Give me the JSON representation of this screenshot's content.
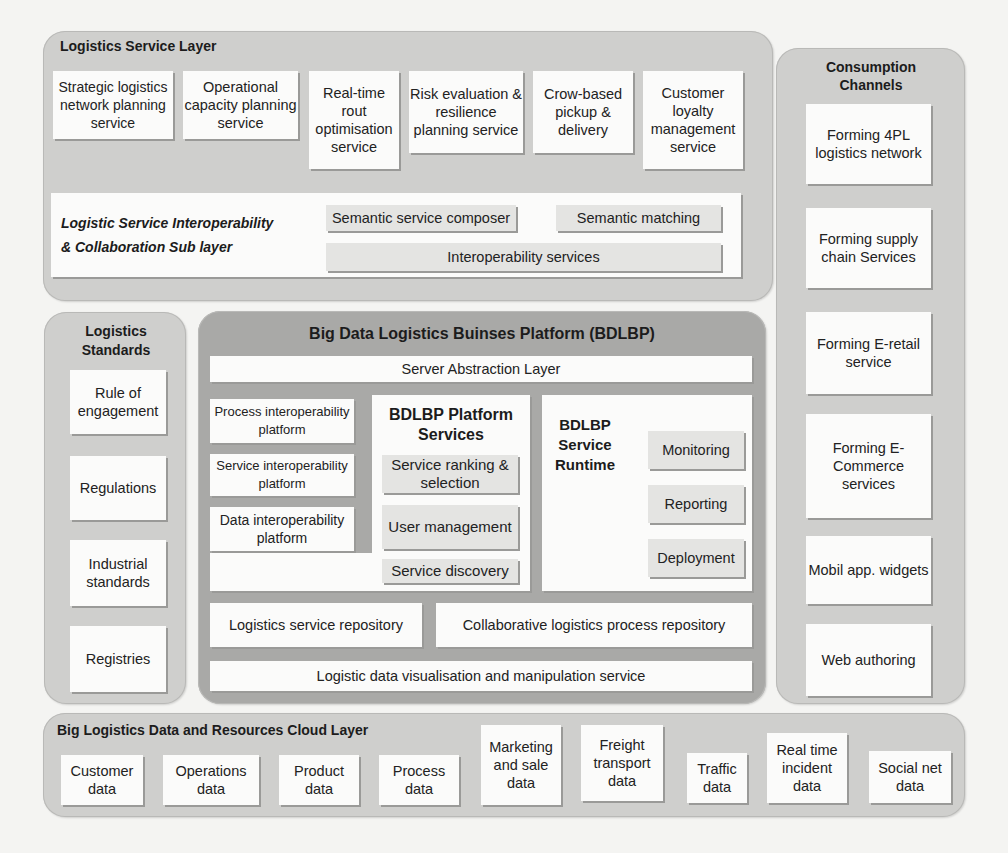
{
  "diagram": {
    "service_layer": {
      "title": "Logistics Service Layer",
      "services": [
        "Strategic logistics network planning service",
        "Operational capacity planning service",
        "Real-time rout optimisation service",
        "Risk evaluation & resilience planning service",
        "Crow-based pickup & delivery",
        "Customer loyalty management service"
      ],
      "sublayer": {
        "title_line1": "Logistic Service Interoperability",
        "title_line2": "& Collaboration Sub layer",
        "items": [
          "Semantic service composer",
          "Semantic matching",
          "Interoperability services"
        ]
      }
    },
    "consumption_channels": {
      "title": "Consumption Channels",
      "items": [
        "Forming 4PL logistics network",
        "Forming supply chain Services",
        "Forming E-retail service",
        "Forming E-Commerce services",
        "Mobil app. widgets",
        "Web authoring"
      ]
    },
    "standards": {
      "title": "Logistics Standards",
      "items": [
        "Rule of engagement",
        "Regulations",
        "Industrial standards",
        "Registries"
      ]
    },
    "platform": {
      "title": "Big Data Logistics Buinses  Platform (BDLBP)",
      "server_abstraction": "Server Abstraction Layer",
      "interoperability_platforms": [
        "Process interoperability platform",
        "Service interoperability platform",
        "Data interoperability platform"
      ],
      "platform_services": {
        "title": "BDLBP Platform Services",
        "items": [
          "Service ranking & selection",
          "User management",
          "Service discovery"
        ]
      },
      "service_runtime": {
        "title": "BDLBP Service Runtime",
        "items": [
          "Monitoring",
          "Reporting",
          "Deployment"
        ]
      },
      "repositories": [
        "Logistics service repository",
        "Collaborative logistics process repository"
      ],
      "visualisation": "Logistic data visualisation and manipulation service"
    },
    "cloud_layer": {
      "title": "Big Logistics  Data and Resources Cloud Layer",
      "items": [
        "Customer data",
        "Operations data",
        "Product data",
        "Process data",
        "Marketing and sale data",
        "Freight transport data",
        "Traffic data",
        "Real time incident data",
        "Social net data"
      ]
    }
  }
}
